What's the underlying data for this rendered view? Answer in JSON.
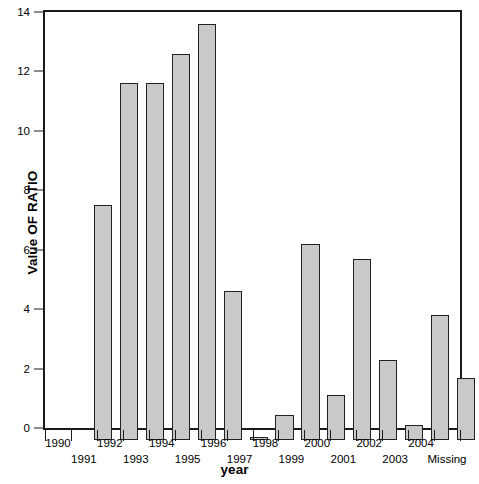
{
  "chart_data": {
    "type": "bar",
    "title": "",
    "xlabel": "year",
    "ylabel": "Value OF RATIO",
    "categories": [
      "1990",
      "1991",
      "1992",
      "1993",
      "1994",
      "1995",
      "1996",
      "1997",
      "1998",
      "1999",
      "2000",
      "2001",
      "2002",
      "2003",
      "2004",
      "Missing"
    ],
    "values": [
      7.9,
      12.0,
      12.0,
      13.0,
      14.0,
      5.0,
      0.1,
      0.85,
      6.6,
      1.5,
      6.1,
      2.7,
      0.5,
      4.2,
      2.1,
      0
    ],
    "ylim": [
      0,
      14
    ],
    "yticks": [
      0,
      2,
      4,
      6,
      8,
      10,
      12,
      14
    ],
    "ytick_labels": [
      "0",
      "2",
      "4",
      "6",
      "8",
      "10",
      "12",
      "14"
    ],
    "grid": false,
    "legend": false,
    "bar_fill_color": "#c9c9c9",
    "bar_edge_color": "#222222",
    "axis_color": "#1a1a1a",
    "background_color": "#ffffff"
  },
  "axes": {
    "y_title": "Value OF RATIO",
    "x_title": "year"
  }
}
